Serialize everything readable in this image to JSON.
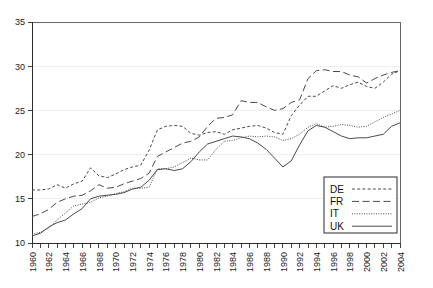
{
  "chart_data": {
    "type": "line",
    "title": "",
    "subtitle": "",
    "xlabel": "",
    "ylabel": "",
    "xlim": [
      1960,
      2004
    ],
    "ylim": [
      10,
      35
    ],
    "yticks": [
      10,
      15,
      20,
      25,
      30,
      35
    ],
    "ytick_labels": [
      "10",
      "15",
      "20",
      "25",
      "30",
      "35"
    ],
    "grid": true,
    "legend_position": "bottom-right",
    "x": [
      1960,
      1961,
      1962,
      1963,
      1964,
      1965,
      1966,
      1967,
      1968,
      1969,
      1970,
      1971,
      1972,
      1973,
      1974,
      1975,
      1976,
      1977,
      1978,
      1979,
      1980,
      1981,
      1982,
      1983,
      1984,
      1985,
      1986,
      1987,
      1988,
      1989,
      1990,
      1991,
      1992,
      1993,
      1994,
      1995,
      1996,
      1997,
      1998,
      1999,
      2000,
      2001,
      2002,
      2003,
      2004
    ],
    "xtick_labels": [
      "1960",
      "1962",
      "1964",
      "1966",
      "1968",
      "1970",
      "1972",
      "1974",
      "1976",
      "1978",
      "1980",
      "1982",
      "1984",
      "1986",
      "1988",
      "1990",
      "1992",
      "1994",
      "1996",
      "1998",
      "2000",
      "2002",
      "2004"
    ],
    "series": [
      {
        "name": "DE",
        "dash": "short-dash",
        "values": [
          16.0,
          16.0,
          16.1,
          16.6,
          16.2,
          16.7,
          17.0,
          18.5,
          17.6,
          17.4,
          17.8,
          18.3,
          18.6,
          18.8,
          20.5,
          22.8,
          23.2,
          23.3,
          23.2,
          22.4,
          22.2,
          22.5,
          22.6,
          22.3,
          22.8,
          23.0,
          23.2,
          23.3,
          23.0,
          22.5,
          22.3,
          24.4,
          25.6,
          26.6,
          26.6,
          27.2,
          27.8,
          27.5,
          27.9,
          28.2,
          27.7,
          27.5,
          28.2,
          29.1,
          29.5
        ]
      },
      {
        "name": "FR",
        "dash": "long-dash",
        "values": [
          13.0,
          13.3,
          13.8,
          14.6,
          15.0,
          15.3,
          15.4,
          15.9,
          16.6,
          16.2,
          16.3,
          16.7,
          17.0,
          17.3,
          17.9,
          19.8,
          20.3,
          20.8,
          21.3,
          21.5,
          22.0,
          23.2,
          24.1,
          24.2,
          24.5,
          26.1,
          25.9,
          25.9,
          25.4,
          25.0,
          25.2,
          25.9,
          26.2,
          28.6,
          29.5,
          29.6,
          29.4,
          29.4,
          29.0,
          28.8,
          28.1,
          28.6,
          29.0,
          29.3,
          29.5
        ]
      },
      {
        "name": "IT",
        "dash": "dotted",
        "values": [
          11.0,
          11.2,
          11.7,
          12.6,
          13.4,
          14.2,
          14.4,
          14.6,
          15.1,
          15.3,
          15.6,
          15.8,
          16.2,
          16.2,
          16.3,
          18.4,
          18.4,
          18.6,
          19.1,
          19.6,
          19.4,
          19.4,
          20.6,
          21.5,
          21.6,
          21.9,
          22.1,
          22.0,
          22.1,
          22.0,
          21.6,
          21.8,
          22.3,
          23.1,
          23.5,
          23.1,
          23.2,
          23.4,
          23.3,
          23.1,
          23.2,
          23.7,
          24.2,
          24.6,
          25.0
        ]
      },
      {
        "name": "UK",
        "dash": "solid",
        "values": [
          10.8,
          11.1,
          11.8,
          12.3,
          12.6,
          13.3,
          13.9,
          15.0,
          15.3,
          15.4,
          15.5,
          15.7,
          16.1,
          16.3,
          17.1,
          18.3,
          18.4,
          18.2,
          18.4,
          19.2,
          20.3,
          21.2,
          21.5,
          21.8,
          22.1,
          22.0,
          21.8,
          21.3,
          20.6,
          19.6,
          18.6,
          19.3,
          21.1,
          22.7,
          23.3,
          23.1,
          22.6,
          22.1,
          21.8,
          21.9,
          21.9,
          22.1,
          22.3,
          23.2,
          23.6
        ]
      }
    ],
    "legend_entries": [
      {
        "label": "DE",
        "dash": "short-dash"
      },
      {
        "label": "FR",
        "dash": "long-dash"
      },
      {
        "label": "IT",
        "dash": "dotted"
      },
      {
        "label": "UK",
        "dash": "solid"
      }
    ]
  }
}
